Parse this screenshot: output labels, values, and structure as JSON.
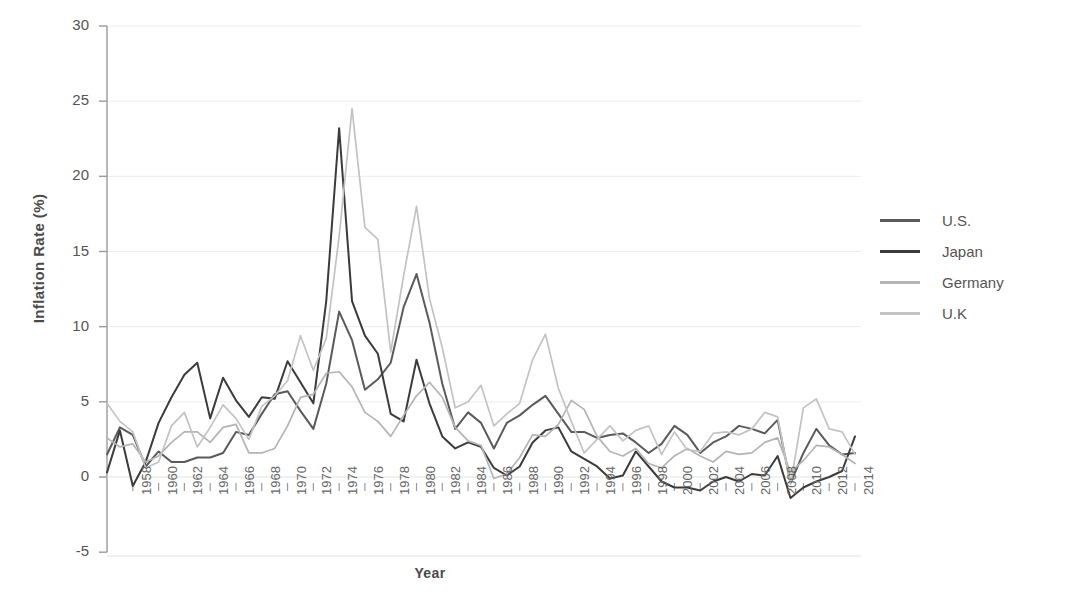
{
  "axes": {
    "ylabel": "Inflation Rate (%)",
    "xlabel": "Year",
    "yticks": [
      30,
      25,
      20,
      15,
      10,
      5,
      0,
      -5
    ],
    "ylim": [
      -5,
      30
    ],
    "xlim": [
      1956,
      2014
    ],
    "xticks": [
      1958,
      1960,
      1962,
      1964,
      1966,
      1968,
      1970,
      1972,
      1974,
      1976,
      1978,
      1980,
      1982,
      1984,
      1986,
      1988,
      1990,
      1992,
      1994,
      1996,
      1998,
      2000,
      2002,
      2004,
      2006,
      2008,
      2010,
      2012,
      2014
    ]
  },
  "legend": {
    "position": "right",
    "entries": [
      {
        "label": "U.S.",
        "color": "#5a5a5a"
      },
      {
        "label": "Japan",
        "color": "#3b3b3b"
      },
      {
        "label": "Germany",
        "color": "#b4b4b4"
      },
      {
        "label": "U.K",
        "color": "#c3c3c3"
      }
    ]
  },
  "colors": {
    "us": "#5a5a5a",
    "japan": "#3b3b3b",
    "germany": "#b4b4b4",
    "uk": "#c3c3c3",
    "axis": "#9a9a9a",
    "grid": "#ececec",
    "tick_text": "#666666",
    "label_text": "#4a4a4a"
  },
  "footer_text": "",
  "chart_data": {
    "type": "line",
    "title": "",
    "xlabel": "Year",
    "ylabel": "Inflation Rate (%)",
    "xlim": [
      1956,
      2014
    ],
    "ylim": [
      -5,
      30
    ],
    "grid": true,
    "legend_position": "right",
    "x": [
      1956,
      1957,
      1958,
      1959,
      1960,
      1961,
      1962,
      1963,
      1964,
      1965,
      1966,
      1967,
      1968,
      1969,
      1970,
      1971,
      1972,
      1973,
      1974,
      1975,
      1976,
      1977,
      1978,
      1979,
      1980,
      1981,
      1982,
      1983,
      1984,
      1985,
      1986,
      1987,
      1988,
      1989,
      1990,
      1991,
      1992,
      1993,
      1994,
      1995,
      1996,
      1997,
      1998,
      1999,
      2000,
      2001,
      2002,
      2003,
      2004,
      2005,
      2006,
      2007,
      2008,
      2009,
      2010,
      2011,
      2012,
      2013,
      2014
    ],
    "series": [
      {
        "name": "U.S.",
        "color": "#5a5a5a",
        "values": [
          1.5,
          3.3,
          2.8,
          0.7,
          1.7,
          1.0,
          1.0,
          1.3,
          1.3,
          1.6,
          3.0,
          2.8,
          4.2,
          5.5,
          5.7,
          4.4,
          3.2,
          6.2,
          11.0,
          9.1,
          5.8,
          6.5,
          7.6,
          11.3,
          13.5,
          10.3,
          6.2,
          3.2,
          4.3,
          3.6,
          1.9,
          3.6,
          4.1,
          4.8,
          5.4,
          4.2,
          3.0,
          3.0,
          2.6,
          2.8,
          2.9,
          2.3,
          1.6,
          2.2,
          3.4,
          2.8,
          1.6,
          2.3,
          2.7,
          3.4,
          3.2,
          2.9,
          3.8,
          -0.4,
          1.6,
          3.2,
          2.1,
          1.5,
          1.6
        ]
      },
      {
        "name": "Japan",
        "color": "#3b3b3b",
        "values": [
          0.3,
          3.1,
          -0.6,
          1.0,
          3.6,
          5.3,
          6.8,
          7.6,
          3.9,
          6.6,
          5.1,
          4.0,
          5.3,
          5.2,
          7.7,
          6.3,
          4.9,
          11.7,
          23.2,
          11.7,
          9.4,
          8.2,
          4.2,
          3.7,
          7.8,
          4.9,
          2.7,
          1.9,
          2.3,
          2.0,
          0.6,
          0.1,
          0.7,
          2.3,
          3.1,
          3.3,
          1.7,
          1.2,
          0.7,
          -0.1,
          0.1,
          1.7,
          0.7,
          -0.3,
          -0.7,
          -0.7,
          -0.9,
          -0.3,
          0.0,
          -0.3,
          0.2,
          0.1,
          1.4,
          -1.4,
          -0.7,
          -0.3,
          0.0,
          0.4,
          2.7
        ]
      },
      {
        "name": "Germany",
        "color": "#b4b4b4",
        "values": [
          2.6,
          2.0,
          2.2,
          1.0,
          1.4,
          2.3,
          3.0,
          3.0,
          2.3,
          3.3,
          3.5,
          1.6,
          1.6,
          1.9,
          3.4,
          5.3,
          5.5,
          6.9,
          7.0,
          6.0,
          4.3,
          3.7,
          2.7,
          4.1,
          5.4,
          6.3,
          5.3,
          3.3,
          2.4,
          2.1,
          -0.1,
          0.2,
          1.3,
          2.8,
          2.7,
          3.5,
          5.1,
          4.5,
          2.7,
          1.7,
          1.4,
          1.9,
          0.9,
          0.6,
          1.4,
          1.9,
          1.4,
          1.0,
          1.7,
          1.5,
          1.6,
          2.3,
          2.6,
          0.3,
          1.1,
          2.1,
          2.0,
          1.5,
          0.9
        ]
      },
      {
        "name": "U.K",
        "color": "#c3c3c3",
        "values": [
          4.9,
          3.7,
          3.0,
          0.6,
          1.0,
          3.4,
          4.3,
          2.0,
          3.3,
          4.8,
          3.9,
          2.5,
          4.7,
          5.4,
          6.4,
          9.4,
          7.1,
          9.2,
          16.0,
          24.5,
          16.6,
          15.8,
          8.3,
          13.4,
          18.0,
          11.9,
          8.6,
          4.6,
          5.0,
          6.1,
          3.4,
          4.2,
          4.9,
          7.8,
          9.5,
          5.9,
          3.7,
          1.6,
          2.5,
          3.4,
          2.4,
          3.1,
          3.4,
          1.5,
          3.0,
          1.8,
          1.7,
          2.9,
          3.0,
          2.8,
          3.2,
          4.3,
          4.0,
          -0.5,
          4.6,
          5.2,
          3.2,
          3.0,
          1.5
        ]
      }
    ]
  }
}
